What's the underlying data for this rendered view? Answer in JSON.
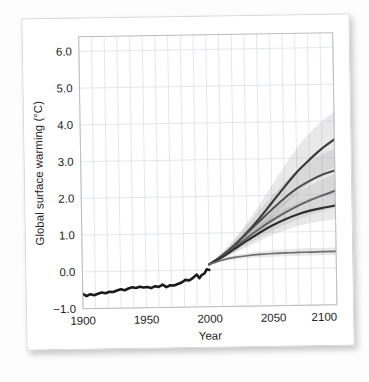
{
  "figure": {
    "background_color": "#ffffff",
    "plot_background_color": "#ffffff",
    "grid_color": "#d9dde4",
    "frame_color": "#b9bcc2",
    "observed_color": "#1a1a1a",
    "projection_color": "#4a4a4a",
    "band_color": "#9a9a9a"
  },
  "chart_data": {
    "type": "line",
    "title": "",
    "subtitle": "",
    "xlabel": "Year",
    "ylabel": "Global surface warming (°C)",
    "xlim": [
      1900,
      2100
    ],
    "ylim": [
      -1.0,
      6.4
    ],
    "xticks": [
      1900,
      1950,
      2000,
      2050,
      2100
    ],
    "xtick_labels": [
      "1900",
      "1950",
      "2000",
      "2050",
      "2100"
    ],
    "yticks": [
      -1.0,
      0.0,
      1.0,
      2.0,
      3.0,
      4.0,
      5.0,
      6.0
    ],
    "ytick_labels": [
      "−1.0",
      "0.0",
      "1.0",
      "2.0",
      "3.0",
      "4.0",
      "5.0",
      "6.0"
    ],
    "grid": true,
    "grid_x_step": 10,
    "grid_y_step": 1.0,
    "legend": "none",
    "legend_position": "none",
    "annotations": [],
    "series": [
      {
        "name": "Observed (20th century)",
        "kind": "observed",
        "color": "#1a1a1a",
        "width": 2.6,
        "x": [
          1900,
          1903,
          1906,
          1909,
          1912,
          1915,
          1918,
          1921,
          1924,
          1927,
          1930,
          1933,
          1936,
          1939,
          1942,
          1945,
          1948,
          1951,
          1954,
          1957,
          1960,
          1963,
          1966,
          1969,
          1972,
          1975,
          1978,
          1981,
          1984,
          1987,
          1990,
          1992,
          1994,
          1996,
          1998,
          2000
        ],
        "values": [
          -0.6,
          -0.66,
          -0.61,
          -0.64,
          -0.6,
          -0.57,
          -0.59,
          -0.55,
          -0.56,
          -0.52,
          -0.49,
          -0.52,
          -0.47,
          -0.44,
          -0.46,
          -0.43,
          -0.45,
          -0.44,
          -0.47,
          -0.42,
          -0.44,
          -0.38,
          -0.45,
          -0.4,
          -0.41,
          -0.37,
          -0.33,
          -0.26,
          -0.28,
          -0.21,
          -0.12,
          -0.22,
          -0.13,
          -0.1,
          0.02,
          0.0
        ]
      },
      {
        "name": "A2",
        "kind": "projection",
        "color": "#3a3a3a",
        "width": 2.2,
        "x": [
          2000,
          2010,
          2020,
          2030,
          2040,
          2050,
          2060,
          2070,
          2080,
          2090,
          2100
        ],
        "values": [
          0.15,
          0.38,
          0.66,
          1.0,
          1.38,
          1.8,
          2.22,
          2.62,
          2.95,
          3.25,
          3.5
        ],
        "band_low": [
          0.15,
          0.3,
          0.5,
          0.76,
          1.05,
          1.38,
          1.72,
          2.04,
          2.32,
          2.56,
          2.75
        ],
        "band_high": [
          0.15,
          0.46,
          0.82,
          1.26,
          1.74,
          2.26,
          2.78,
          3.26,
          3.66,
          3.98,
          4.25
        ]
      },
      {
        "name": "A1B",
        "kind": "projection",
        "color": "#4d4d4d",
        "width": 2.0,
        "x": [
          2000,
          2010,
          2020,
          2030,
          2040,
          2050,
          2060,
          2070,
          2080,
          2090,
          2100
        ],
        "values": [
          0.15,
          0.38,
          0.66,
          0.98,
          1.3,
          1.62,
          1.92,
          2.18,
          2.38,
          2.54,
          2.65
        ],
        "band_low": [
          0.15,
          0.31,
          0.52,
          0.76,
          1.01,
          1.26,
          1.5,
          1.7,
          1.86,
          1.98,
          2.06
        ],
        "band_high": [
          0.15,
          0.45,
          0.8,
          1.2,
          1.59,
          1.98,
          2.34,
          2.66,
          2.9,
          3.1,
          3.24
        ]
      },
      {
        "name": "B1",
        "kind": "projection",
        "color": "#636363",
        "width": 1.9,
        "x": [
          2000,
          2010,
          2020,
          2030,
          2040,
          2050,
          2060,
          2070,
          2080,
          2090,
          2100
        ],
        "values": [
          0.15,
          0.36,
          0.6,
          0.86,
          1.1,
          1.32,
          1.52,
          1.7,
          1.85,
          1.98,
          2.1
        ],
        "band_low": [
          0.15,
          0.29,
          0.47,
          0.67,
          0.86,
          1.03,
          1.19,
          1.33,
          1.45,
          1.55,
          1.64
        ],
        "band_high": [
          0.15,
          0.43,
          0.73,
          1.05,
          1.34,
          1.61,
          1.85,
          2.07,
          2.25,
          2.41,
          2.56
        ]
      },
      {
        "name": "B2 / lower scenario",
        "kind": "projection",
        "color": "#2f2f2f",
        "width": 2.2,
        "x": [
          2000,
          2010,
          2020,
          2030,
          2040,
          2050,
          2060,
          2070,
          2080,
          2090,
          2100
        ],
        "values": [
          0.15,
          0.34,
          0.56,
          0.78,
          0.99,
          1.18,
          1.34,
          1.47,
          1.57,
          1.64,
          1.7
        ],
        "band_low": [
          0.15,
          0.27,
          0.44,
          0.61,
          0.77,
          0.92,
          1.05,
          1.15,
          1.23,
          1.28,
          1.33
        ],
        "band_high": [
          0.15,
          0.41,
          0.68,
          0.95,
          1.21,
          1.44,
          1.63,
          1.79,
          1.91,
          2.0,
          2.07
        ]
      },
      {
        "name": "Constant composition commitment",
        "kind": "projection",
        "color": "#6e6e6e",
        "width": 1.6,
        "x": [
          2000,
          2010,
          2020,
          2030,
          2040,
          2050,
          2060,
          2070,
          2080,
          2090,
          2100
        ],
        "values": [
          0.15,
          0.26,
          0.33,
          0.37,
          0.4,
          0.42,
          0.43,
          0.44,
          0.44,
          0.45,
          0.45
        ],
        "band_low": [
          0.15,
          0.22,
          0.27,
          0.3,
          0.32,
          0.33,
          0.34,
          0.34,
          0.35,
          0.35,
          0.35
        ],
        "band_high": [
          0.15,
          0.3,
          0.39,
          0.44,
          0.48,
          0.51,
          0.53,
          0.54,
          0.55,
          0.55,
          0.56
        ]
      }
    ]
  }
}
